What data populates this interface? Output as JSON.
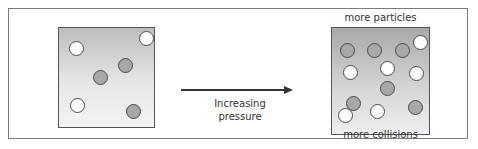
{
  "diagram": {
    "arrow_label_line1": "Increasing",
    "arrow_label_line2": "pressure",
    "right_box_top_label": "more particles",
    "right_box_bottom_label": "more collisions",
    "colors": {
      "particle_white": "#ffffff",
      "particle_grey": "#a8a8a8",
      "outline": "#4a4a4a",
      "frame": "#7a7a7a"
    },
    "left_box": {
      "state": "low pressure",
      "particles": [
        {
          "type": "white",
          "x": 10,
          "y": 13
        },
        {
          "type": "white",
          "x": 80,
          "y": 3
        },
        {
          "type": "grey",
          "x": 34,
          "y": 42
        },
        {
          "type": "grey",
          "x": 59,
          "y": 30
        },
        {
          "type": "white",
          "x": 11,
          "y": 70
        },
        {
          "type": "grey",
          "x": 67,
          "y": 76
        }
      ]
    },
    "right_box": {
      "state": "high pressure",
      "particles": [
        {
          "type": "grey",
          "x": 8,
          "y": 15
        },
        {
          "type": "grey",
          "x": 35,
          "y": 15
        },
        {
          "type": "grey",
          "x": 63,
          "y": 15
        },
        {
          "type": "white",
          "x": 81,
          "y": 7
        },
        {
          "type": "white",
          "x": 11,
          "y": 37
        },
        {
          "type": "white",
          "x": 48,
          "y": 33
        },
        {
          "type": "white",
          "x": 77,
          "y": 38
        },
        {
          "type": "grey",
          "x": 48,
          "y": 53
        },
        {
          "type": "grey",
          "x": 14,
          "y": 68
        },
        {
          "type": "white",
          "x": 6,
          "y": 80
        },
        {
          "type": "white",
          "x": 38,
          "y": 76
        },
        {
          "type": "grey",
          "x": 76,
          "y": 72
        }
      ]
    }
  }
}
